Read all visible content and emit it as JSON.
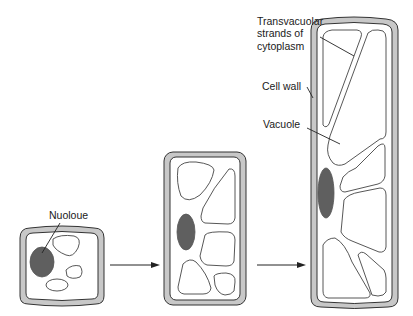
{
  "diagram": {
    "labels": {
      "transvacuolar": [
        "Transvacuolar",
        "strands of",
        "cytoplasm"
      ],
      "cell_wall": "Cell wall",
      "vacuole": "Vacuole",
      "nucleus": "Nuoloue"
    },
    "stages": [
      {
        "name": "small-cell",
        "description": "young cell with small vacuoles"
      },
      {
        "name": "medium-cell",
        "description": "enlarging cell with larger vacuoles"
      },
      {
        "name": "large-cell",
        "description": "elongated cell with large vacuole and transvacuolar strands"
      }
    ],
    "colors": {
      "wall_fill": "#c8c8c8",
      "nucleus_fill": "#5f5f5f",
      "outline": "#333333",
      "background": "#ffffff"
    }
  }
}
